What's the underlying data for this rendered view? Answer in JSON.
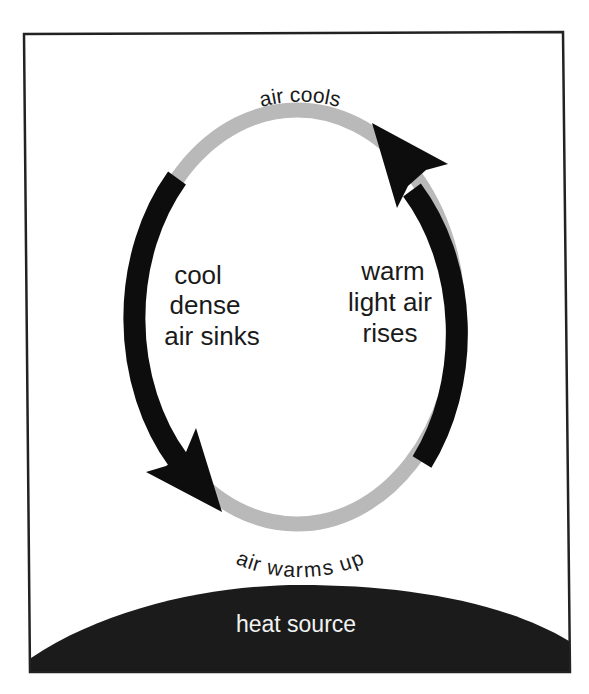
{
  "diagram": {
    "colors": {
      "frame": "#222222",
      "ring_gray": "#b9b9b9",
      "arrow_black": "#0d0d0d",
      "heat_source_fill": "#1b1b1b",
      "heat_source_text": "#f2f2f2",
      "text": "#1a1a1a"
    },
    "labels": {
      "top": "air cools",
      "bottom": "air warms up",
      "left_lines": [
        "cool",
        "dense",
        "air sinks"
      ],
      "right_lines": [
        "warm",
        "light air",
        "rises"
      ],
      "heat_source": "heat source"
    },
    "arrows": [
      {
        "name": "sinking-arrow",
        "side": "left",
        "direction": "down"
      },
      {
        "name": "rising-arrow",
        "side": "right",
        "direction": "up"
      }
    ]
  }
}
